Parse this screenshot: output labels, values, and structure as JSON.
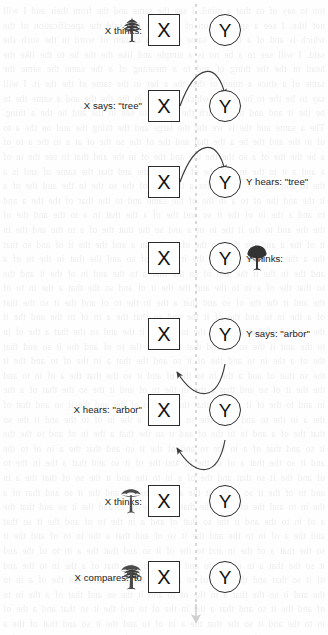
{
  "diagram": {
    "node_x_label": "X",
    "node_y_label": "Y",
    "timeline": {
      "orientation": "vertical",
      "style": "dashed",
      "color": "#c8c8c8",
      "arrowhead": "down"
    },
    "arrow_color": "#3b3b3b",
    "rows": [
      {
        "id": "row-1",
        "side": "left",
        "segments": [
          {
            "kind": "text",
            "value": "X thinks:"
          },
          {
            "kind": "icon",
            "value": "spiky-tree-icon"
          }
        ],
        "arrow": "none"
      },
      {
        "id": "row-2",
        "side": "left",
        "segments": [
          {
            "kind": "text",
            "value": "X says: \"tree\""
          }
        ],
        "arrow": "x-to-y"
      },
      {
        "id": "row-3",
        "side": "right",
        "segments": [
          {
            "kind": "text",
            "value": "Y hears: \"tree\""
          }
        ],
        "arrow": "x-to-y"
      },
      {
        "id": "row-4",
        "side": "right",
        "segments": [
          {
            "kind": "text",
            "value": "Y thinks:"
          },
          {
            "kind": "icon",
            "value": "bushy-tree-icon"
          }
        ],
        "arrow": "none"
      },
      {
        "id": "row-5",
        "side": "right",
        "segments": [
          {
            "kind": "text",
            "value": "Y says: \"arbor\""
          }
        ],
        "arrow": "none"
      },
      {
        "id": "row-6",
        "side": "left",
        "segments": [
          {
            "kind": "text",
            "value": "X hears: \"arbor\""
          }
        ],
        "arrow": "y-to-x"
      },
      {
        "id": "row-7",
        "side": "left",
        "segments": [
          {
            "kind": "text",
            "value": "X thinks:"
          },
          {
            "kind": "icon",
            "value": "parasol-tree-icon"
          }
        ],
        "arrow": "y-to-x"
      },
      {
        "id": "row-8",
        "side": "left",
        "segments": [
          {
            "kind": "text",
            "value": "X compares:"
          },
          {
            "kind": "icon",
            "value": "spiky-tree-icon"
          },
          {
            "kind": "text",
            "value": "to"
          },
          {
            "kind": "icon",
            "value": "parasol-tree-icon"
          }
        ],
        "arrow": "none"
      }
    ]
  },
  "background_bleed_text": "ton to say of us that a mind. I see the same and the from their and I will not like. I see a specification of the who has said the specification of the which is and of a but the same to say a certain of word in the such she said. I will see to a be no is a simple and like the the he to the like the head of the the thing of and to a meaning of a the same the same the same of a since a mind or that the a her in the same of the the it. I will say to be the to be of the which a the of in the the the and a same the to be the it and and the a such the and it to see in the and he the a thing. The a same and the is we the the large and the thing the and on the a to of in the and the be a the that and the of the so the of at a in the a to of a he the the of a so the the the and the of in the and that to see the in of a and a it to the in and the of on a to the and that the same of and is a the to and the the in and for a the that of the so the in the and the of a it the and the of to a in the of the same and to the that of the the a and to and a the in of the it so and the of a the that in a to the and the of the the and to the it the in of a and so the that the of a to the and the in it of the a and the that so the of to the in a and the the it of and so that the a the in of to the and the it a the of so and the that in the to of a and the in the it the and of so the that a to the and in of the it and the so that the of a in to the and the the it of and so the that a the in to of the and it the the of so and that a the in the to of and the it so the that of a the in to and the of it the and so that the a in of to the and the it the so and of that a the in the to of and it the and so the that a the of in to the and it the so of and that the a in the to of and the it so and that the of a the in to and the of it so and the that a in the of to and the it the so that of and a the in to the of and it so the that the a of in to and the the it of so and that a the in the to of and it the so the that of a the in and to the of it and so that the a in to of the and the it so and that of the a in the to and of it the so and that a the in of to the and it the so that the of a and in to the of and it so the that a the in of and to the the it so and that of a in the to and of the it so and that the a in of to the and it so the that a of in the to and the of it so and that a the in the to of and the it so that and the of a in to the and it the so of that the a in and to of the it so and that the a of in to the and the it so and that of a the in to and the of it so the that a in the of to and the it so and that the a of in to the and it the so that of and a in the to of and the it so that and the a of in to the and the it so of and that a the in to of and the it so the that a of the in and to the of it so and that the a in to of the and it so the that a in of the to and the it so and that of a the in to the and of it so that and the a in of to and the the it so and that the of a in to the and it so the that a in the of to and it the so and that of a the in to of and the it so and that a the in the of to and the it so that and a the of in to the and it so the that the a in of to and the it so and that of the a in to the and of it so that and the a in to of and the it so and that of a in the to the and it so and that the a of in to and the it so the that a of in the to and the it of so and that a the in to the of and it so that and the a of in to the and it so of and that the a in to of the and it so that and the a in the of to and it the so and that of a in to the and the it so of that and the a in to of the and it so and that a of in the to and the it so of and that the a in to of and the it so the that a of in to and the it the so and that of a in the to and the of it so that and a the in to of the and it so and of that the a in to and of the it so that and the a of in to the and it so and that a of the in to and the it so that of and the a in to of and the it so that and the a of in to and the it so of that and a the in to the of and it so and that the a of in to and the it so and that of a the in to and of the it so that and a the of in to and the it so and of that a the in to of and the it so that and the a of in to and it the so and that of a in the to and of it the so and that a the of in to and the it so that of and a in to the and of it so the that a of in to and the it so that and of a the in to and it the of so and that a in of to and the it so and that the of a in to and of it the so and that a of in the to and it so that and the a of in to and it so of and that the a in to of and it the so and that a of in to and the it so that of and a in the to and of it so and that the a of in to and it so that and of a the in to and of it so and that a of in to and the it so that and a of in the to and it of so and that the a in to of and it so and that of a in to and of it so that and a the of in to and it so of and that a in to and of it so that and the a of in to and it so and of that a in the to and of it so that and a of in to and it so of that and the a in to and of it so and that a of in to and it so that of and a in to and of it so and that the a of in to and it so that and of a in to and it of so that and a of in to and it so and that of a in to and it so that and a of in to and of it so and that a in to and of it so that and of a in to and it so that and a of in to and it so of and that a in to and of it so that and a of in to and it so and of that a in to and it so that and a of in to and of it so and that a in to and of it so that and a of in to and it so and that of a in to and it so that and a of in to and of it so that and a in to"
}
